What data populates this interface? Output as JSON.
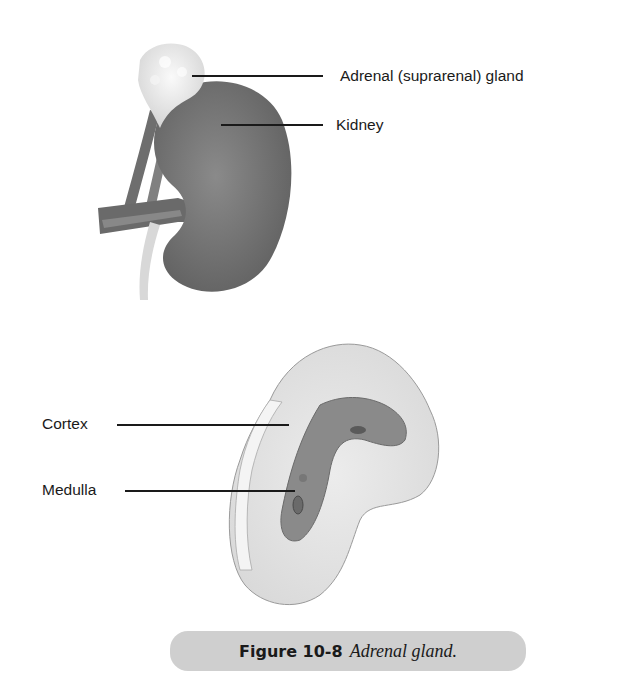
{
  "figure": {
    "top_illustration": {
      "name": "kidney with adrenal gland",
      "labels": [
        {
          "id": "adrenal",
          "text": "Adrenal (suprarenal) gland"
        },
        {
          "id": "kidney",
          "text": "Kidney"
        }
      ]
    },
    "bottom_illustration": {
      "name": "adrenal gland cross-section",
      "labels": [
        {
          "id": "cortex",
          "text": "Cortex"
        },
        {
          "id": "medulla",
          "text": "Medulla"
        }
      ]
    },
    "caption": {
      "number": "Figure 10-8",
      "text": "Adrenal gland."
    },
    "colors": {
      "caption_bg": "#cfcfcf",
      "kidney": "#7d7d7d",
      "adrenal": "#ececec",
      "medulla": "#8a8a8a",
      "cortex": "#e4e4e4"
    }
  }
}
